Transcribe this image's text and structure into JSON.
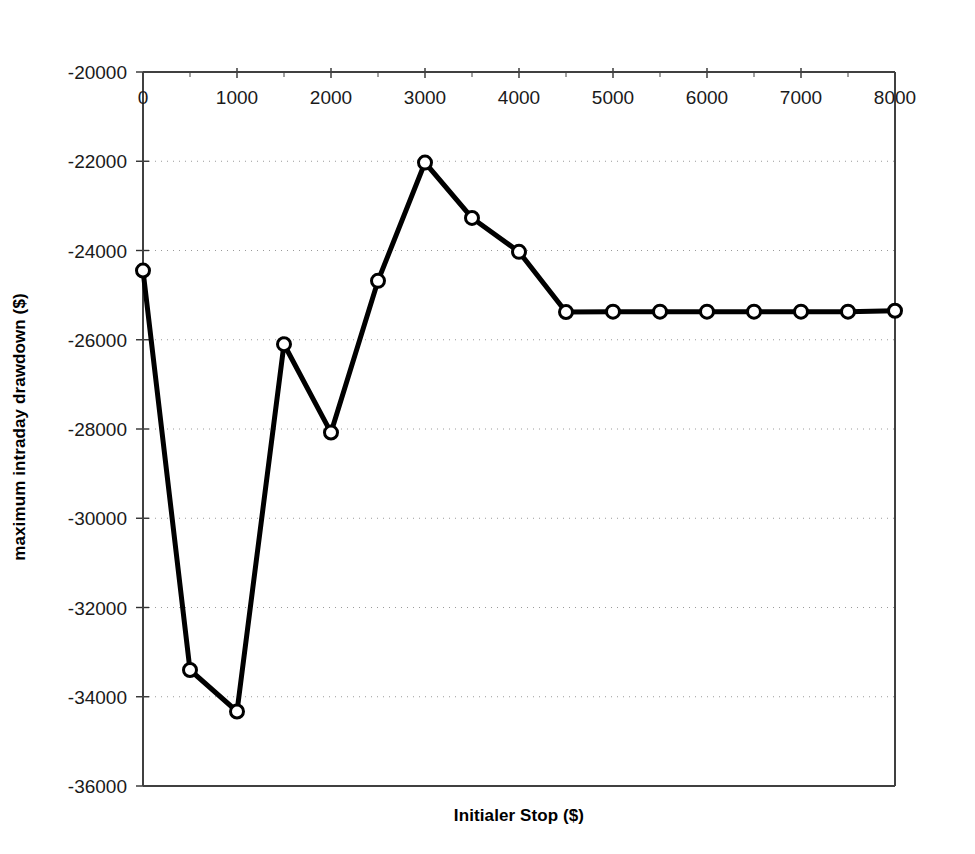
{
  "chart_data": {
    "type": "line",
    "title": "",
    "xlabel": "Initialer Stop ($)",
    "ylabel": "maximum intraday drawdown ($)",
    "xlim": [
      0,
      8000
    ],
    "ylim": [
      -36000,
      -20000
    ],
    "x_major_step": 1000,
    "x_minor_step": 500,
    "y_major_step": 2000,
    "grid": "horizontal-dotted",
    "legend": "none",
    "x_axis_position": "top",
    "marker": "open-circle",
    "line_color": "#000000",
    "marker_face_color": "#ffffff",
    "x_tick_labels": [
      "0",
      "1000",
      "2000",
      "3000",
      "4000",
      "5000",
      "6000",
      "7000",
      "8000"
    ],
    "x_tick_values": [
      0,
      1000,
      2000,
      3000,
      4000,
      5000,
      6000,
      7000,
      8000
    ],
    "y_tick_labels": [
      "-20000",
      "-22000",
      "-24000",
      "-26000",
      "-28000",
      "-30000",
      "-32000",
      "-34000",
      "-36000"
    ],
    "y_tick_values": [
      -20000,
      -22000,
      -24000,
      -26000,
      -28000,
      -30000,
      -32000,
      -34000,
      -36000
    ],
    "x": [
      0,
      500,
      1000,
      1500,
      2000,
      2500,
      3000,
      3500,
      4000,
      4500,
      5000,
      5500,
      6000,
      6500,
      7000,
      7500,
      8000
    ],
    "values": [
      -24450,
      -33400,
      -34330,
      -26100,
      -28080,
      -24680,
      -22030,
      -23270,
      -24030,
      -25380,
      -25370,
      -25370,
      -25370,
      -25370,
      -25370,
      -25370,
      -25350
    ],
    "series": [
      {
        "name": "maximum intraday drawdown",
        "values": [
          -24450,
          -33400,
          -34330,
          -26100,
          -28080,
          -24680,
          -22030,
          -23270,
          -24030,
          -25380,
          -25370,
          -25370,
          -25370,
          -25370,
          -25370,
          -25370,
          -25350
        ]
      }
    ]
  },
  "plot_geometry": {
    "left": 143,
    "right": 895,
    "top": 72,
    "bottom": 786
  }
}
